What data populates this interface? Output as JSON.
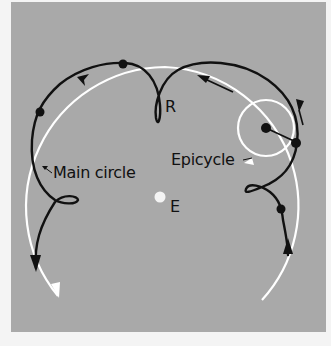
{
  "figure": {
    "type": "epicycle-retrograde-motion-diagram",
    "background_color": "#a9a9a9",
    "path_color": "#111111",
    "circle_color": "#ffffff",
    "labels": {
      "retrograde": "R",
      "main_circle": "Main circle",
      "epicycle": "Epicycle",
      "earth": "E"
    },
    "elements": {
      "earth_dot": {
        "x": 160,
        "y": 197
      },
      "main_circle": {
        "cx": 160,
        "cy": 205,
        "r": 138
      },
      "epicycle": {
        "cx": 266,
        "cy": 128,
        "r": 28
      },
      "planet_positions": [
        {
          "x": 40,
          "y": 112
        },
        {
          "x": 123,
          "y": 64
        },
        {
          "x": 296,
          "y": 143
        },
        {
          "x": 281,
          "y": 209
        }
      ],
      "epicycle_center_dot": {
        "x": 266,
        "y": 128
      }
    }
  }
}
